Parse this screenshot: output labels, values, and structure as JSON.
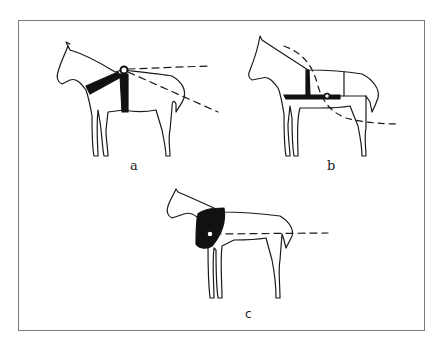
{
  "figure": {
    "panels": [
      {
        "id": "a",
        "label": "a",
        "description": "horse with breast-collar harness; two tow lines from withers point"
      },
      {
        "id": "b",
        "label": "b",
        "description": "horse with girth harness and flank strap; tow line from side point"
      },
      {
        "id": "c",
        "label": "c",
        "description": "horse with wide collar harness; horizontal tow line from shoulder point"
      }
    ],
    "colors": {
      "line": "#1a1a1a",
      "fill": "#111111",
      "frame": "#7a7a7a",
      "background": "#ffffff"
    }
  }
}
